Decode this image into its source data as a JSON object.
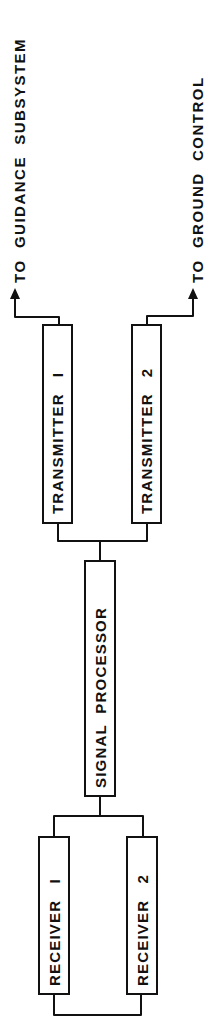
{
  "diagram": {
    "type": "block-diagram",
    "orientation": "rotated-90",
    "blocks": [
      {
        "id": "receiver-1",
        "label": "RECEIVER   I"
      },
      {
        "id": "receiver-2",
        "label": "RECEIVER   2"
      },
      {
        "id": "signal-processor",
        "label": "SIGNAL  PROCESSOR"
      },
      {
        "id": "transmitter-1",
        "label": "TRANSMITTER   I"
      },
      {
        "id": "transmitter-2",
        "label": "TRANSMITTER   2"
      }
    ],
    "outputs": [
      {
        "id": "to-guidance",
        "label": "TO  GUIDANCE  SUBSYSTEM"
      },
      {
        "id": "to-ground",
        "label": "TO  GROUND  CONTROL"
      }
    ],
    "connections": [
      {
        "from": "receiver-1",
        "to": "receiver-2"
      },
      {
        "from": "receiver-1",
        "to": "signal-processor"
      },
      {
        "from": "receiver-2",
        "to": "signal-processor"
      },
      {
        "from": "signal-processor",
        "to": "transmitter-1"
      },
      {
        "from": "signal-processor",
        "to": "transmitter-2"
      },
      {
        "from": "transmitter-1",
        "to": "to-guidance"
      },
      {
        "from": "transmitter-2",
        "to": "to-ground"
      }
    ],
    "colors": {
      "line": "#111111",
      "background": "#ffffff"
    }
  }
}
